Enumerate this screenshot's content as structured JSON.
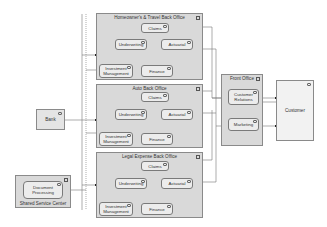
{
  "diagram": {
    "groups": [
      {
        "id": "homeowners",
        "title": "Homeowner's & Travel Back Office",
        "nodes": {
          "claims": "Claims",
          "underwriting": "Underwriting",
          "actuarial": "Actuarial",
          "investment": "Investment Management",
          "finance": "Finance"
        }
      },
      {
        "id": "auto",
        "title": "Auto Back Office",
        "nodes": {
          "claims": "Claims",
          "underwriting": "Underwriting",
          "actuarial": "Actuarial",
          "investment": "Investment Management",
          "finance": "Finance"
        }
      },
      {
        "id": "legal",
        "title": "Legal Expense Back Office",
        "nodes": {
          "claims": "Claims",
          "underwriting": "Underwriting",
          "actuarial": "Actuarial",
          "investment": "Investment Management",
          "finance": "Finance"
        }
      }
    ],
    "front_office": {
      "title": "Front Office",
      "nodes": {
        "customer_relations": "Customer Relations",
        "marketing": "Marketing"
      }
    },
    "customer": {
      "label": "Customer"
    },
    "bank": {
      "label": "Bank"
    },
    "shared_service_center": {
      "title": "Shared Service Center",
      "node": "Document Processing"
    },
    "icon_glyph": "⊠"
  }
}
